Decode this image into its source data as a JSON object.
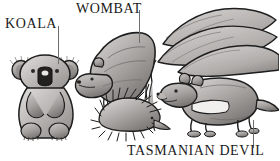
{
  "figure": {
    "width": 279,
    "height": 161,
    "background_color": "#ffffff",
    "style": "grayscale engraved illustration"
  },
  "labels": {
    "koala": "KOALA",
    "wombat": "WOMBAT",
    "tasmanian_devil": "TASMANIAN DEVIL"
  },
  "leader_lines": [
    {
      "label": "KOALA",
      "from_x": 58,
      "from_y": 26,
      "to_x": 58,
      "to_y": 64,
      "color": "#6e6e6e"
    },
    {
      "label": "WOMBAT",
      "from_x": 139,
      "from_y": 10,
      "to_x": 139,
      "to_y": 43,
      "color": "#6e6e6e"
    },
    {
      "label": "TASMANIAN DEVIL",
      "from_x": 253,
      "from_y": 120,
      "to_x": 253,
      "to_y": 148,
      "color": "#6e6e6e"
    }
  ],
  "animals": [
    {
      "name": "koala",
      "label": "KOALA",
      "labelled": true,
      "pose": "sitting upright, front-facing",
      "bounds": {
        "x": 14,
        "y": 58,
        "w": 62,
        "h": 80
      }
    },
    {
      "name": "wombat",
      "label": "WOMBAT",
      "labelled": true,
      "pose": "standing quadruped, head lowered to left",
      "bounds": {
        "x": 76,
        "y": 30,
        "w": 78,
        "h": 80
      }
    },
    {
      "name": "echidna",
      "label": "",
      "labelled": false,
      "pose": "low spiny body, snout to right",
      "bounds": {
        "x": 96,
        "y": 88,
        "w": 66,
        "h": 44
      }
    },
    {
      "name": "kangaroo-claws",
      "label": "",
      "labelled": false,
      "pose": "large overlapping claw forms, upper right",
      "bounds": {
        "x": 158,
        "y": 8,
        "w": 121,
        "h": 62
      }
    },
    {
      "name": "tasmanian-devil",
      "label": "TASMANIAN DEVIL",
      "labelled": true,
      "pose": "standing quadruped facing left, white chest band",
      "bounds": {
        "x": 160,
        "y": 68,
        "w": 112,
        "h": 66
      }
    }
  ],
  "colors": {
    "ink": "#1b1b1b",
    "leader": "#6e6e6e",
    "fur_light": "#d6d4d2",
    "fur_mid": "#a8a5a3",
    "fur_dark": "#74716f",
    "shadow": "#4a4846",
    "paper": "#ffffff"
  }
}
